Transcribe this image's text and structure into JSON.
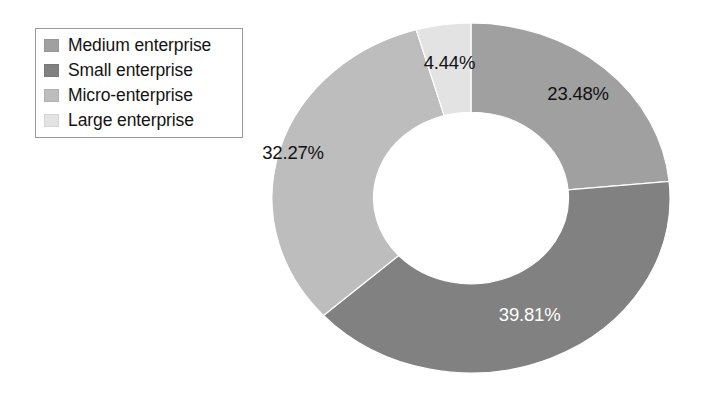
{
  "legend": {
    "items": [
      {
        "label": "Medium enterprise",
        "color": "#a0a0a0"
      },
      {
        "label": "Small enterprise",
        "color": "#818181"
      },
      {
        "label": "Micro-enterprise",
        "color": "#bdbdbd"
      },
      {
        "label": "Large enterprise",
        "color": "#e3e3e3"
      }
    ]
  },
  "labels": {
    "medium": "23.48%",
    "small": "39.81%",
    "micro": "32.27%",
    "large": "4.44%"
  },
  "chart_data": {
    "type": "pie",
    "variant": "donut",
    "title": "",
    "xlabel": "",
    "ylabel": "",
    "hole_ratio": 0.49,
    "start_angle_deg": 0,
    "direction": "clockwise",
    "legend_position": "top-left",
    "grid": false,
    "categories": [
      "Medium enterprise",
      "Small enterprise",
      "Micro-enterprise",
      "Large enterprise"
    ],
    "values": [
      23.48,
      39.81,
      32.27,
      4.44
    ],
    "value_labels": [
      "23.48%",
      "39.81%",
      "32.27%",
      "4.44%"
    ],
    "colors": [
      "#a0a0a0",
      "#818181",
      "#bdbdbd",
      "#e3e3e3"
    ],
    "label_text_colors": [
      "#111111",
      "#ffffff",
      "#111111",
      "#111111"
    ],
    "total": 100.0,
    "units": "percent",
    "slice_order_clockwise_from_top": [
      "Medium enterprise",
      "Small enterprise",
      "Micro-enterprise",
      "Large enterprise"
    ]
  }
}
